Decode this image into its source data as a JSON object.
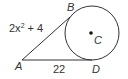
{
  "diagram": {
    "type": "geometry-tangent-segments",
    "points": {
      "A": {
        "label": "A"
      },
      "B": {
        "label": "B"
      },
      "C": {
        "label": "C"
      },
      "D": {
        "label": "D"
      }
    },
    "segments": {
      "AB": {
        "expr_base": "2x",
        "expr_exp": "2",
        "expr_tail": " + 4"
      },
      "AD": {
        "value": "22"
      }
    },
    "colors": {
      "stroke": "#333333",
      "text": "#333333"
    }
  }
}
